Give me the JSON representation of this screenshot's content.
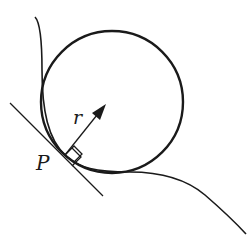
{
  "diagram": {
    "labels": {
      "point": "P",
      "radius": "r"
    },
    "colors": {
      "stroke": "#1a1a1a",
      "background": "#ffffff"
    },
    "elements": [
      "curve",
      "osculating-circle",
      "tangent-line",
      "radius-arrow",
      "right-angle-marker"
    ]
  }
}
